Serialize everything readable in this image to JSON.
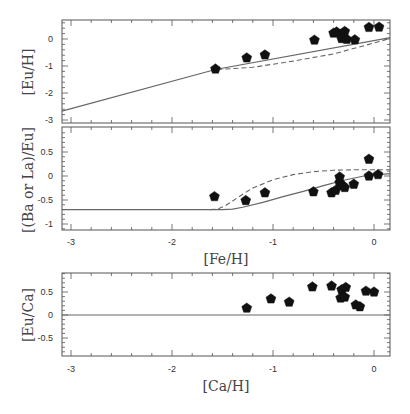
{
  "chart_data": [
    {
      "type": "scatter",
      "panel": "top",
      "title": "",
      "xlabel": "",
      "ylabel": "[Eu/H]",
      "xlim": [
        -3.09,
        0.16
      ],
      "ylim": [
        -3.1,
        0.7
      ],
      "xticks": [
        -3,
        -2,
        -1,
        0
      ],
      "yticks": [
        -3,
        -2,
        -1,
        0
      ],
      "ytick_labels": [
        "-3",
        "-2",
        "-1",
        "0"
      ],
      "grid": false,
      "series": [
        {
          "name": "observations",
          "kind": "points",
          "marker": "pentagon",
          "x": [
            -1.57,
            -1.26,
            -1.08,
            -0.59,
            -0.4,
            -0.37,
            -0.31,
            -0.29,
            -0.32,
            -0.27,
            -0.19,
            -0.05,
            0.05
          ],
          "y": [
            -1.11,
            -0.7,
            -0.59,
            -0.04,
            0.22,
            0.26,
            0.2,
            0.28,
            0.02,
            -0.01,
            -0.03,
            0.43,
            0.44
          ]
        },
        {
          "name": "model (solid)",
          "kind": "line",
          "style": "solid",
          "x": [
            -3.09,
            -1.57,
            0.16
          ],
          "y": [
            -2.67,
            -1.13,
            0.05
          ]
        },
        {
          "name": "model (dashed)",
          "kind": "line",
          "style": "dashed",
          "x": [
            -1.55,
            -1.2,
            -0.8,
            -0.4,
            0.0,
            0.16
          ],
          "y": [
            -1.13,
            -1.05,
            -0.82,
            -0.55,
            -0.15,
            0.02
          ]
        }
      ]
    },
    {
      "type": "scatter",
      "panel": "middle",
      "title": "",
      "xlabel": "[Fe/H]",
      "ylabel": "[(Ba or La)/Eu]",
      "xlim": [
        -3.09,
        0.16
      ],
      "ylim": [
        -1.1,
        0.95
      ],
      "xticks": [
        -3,
        -2,
        -1,
        0
      ],
      "xtick_labels": [
        "-3",
        "-2",
        "-1",
        "0"
      ],
      "yticks": [
        -1,
        -0.5,
        0,
        0.5
      ],
      "ytick_labels": [
        "-1",
        "-0.5",
        "0",
        "0.5"
      ],
      "grid": false,
      "series": [
        {
          "name": "observations",
          "kind": "points",
          "marker": "pentagon",
          "x": [
            -1.58,
            -1.27,
            -1.08,
            -0.6,
            -0.42,
            -0.38,
            -0.34,
            -0.34,
            -0.31,
            -0.29,
            -0.2,
            -0.05,
            -0.05,
            0.04
          ],
          "y": [
            -0.43,
            -0.51,
            -0.35,
            -0.33,
            -0.35,
            -0.3,
            -0.02,
            -0.14,
            -0.2,
            -0.24,
            -0.17,
            0.0,
            0.35,
            0.03
          ]
        },
        {
          "name": "model (solid)",
          "kind": "line",
          "style": "solid",
          "x": [
            -3.09,
            -2.0,
            -1.5,
            -1.4,
            -1.3,
            -1.1,
            -0.9,
            -0.7,
            -0.5,
            -0.3,
            -0.1,
            0.16
          ],
          "y": [
            -0.7,
            -0.7,
            -0.7,
            -0.69,
            -0.65,
            -0.55,
            -0.43,
            -0.32,
            -0.2,
            -0.09,
            0.0,
            0.05
          ]
        },
        {
          "name": "model (dashed)",
          "kind": "line",
          "style": "dashed",
          "x": [
            -1.62,
            -1.55,
            -1.48,
            -1.4,
            -1.3,
            -1.2,
            -1.0,
            -0.8,
            -0.6,
            -0.4,
            -0.2,
            0.16
          ],
          "y": [
            -0.7,
            -0.69,
            -0.63,
            -0.52,
            -0.38,
            -0.25,
            -0.08,
            0.03,
            0.09,
            0.12,
            0.13,
            0.13
          ]
        }
      ]
    },
    {
      "type": "scatter",
      "panel": "bottom",
      "title": "",
      "xlabel": "[Ca/H]",
      "ylabel": "[Eu/Ca]",
      "xlim": [
        -3.09,
        0.16
      ],
      "ylim": [
        -0.9,
        0.9
      ],
      "xticks": [
        -3,
        -2,
        -1,
        0
      ],
      "xtick_labels": [
        "-3",
        "-2",
        "-1",
        "0"
      ],
      "yticks": [
        -0.5,
        0,
        0.5
      ],
      "ytick_labels": [
        "-0.5",
        "0",
        "0.5"
      ],
      "grid": false,
      "series": [
        {
          "name": "observations",
          "kind": "points",
          "marker": "pentagon",
          "x": [
            -1.26,
            -1.02,
            -0.84,
            -0.61,
            -0.42,
            -0.32,
            -0.28,
            -0.33,
            -0.29,
            -0.18,
            -0.14,
            -0.08,
            0.0
          ],
          "y": [
            0.15,
            0.35,
            0.28,
            0.61,
            0.63,
            0.55,
            0.6,
            0.37,
            0.39,
            0.22,
            0.18,
            0.52,
            0.5
          ]
        },
        {
          "name": "reference (solid)",
          "kind": "line",
          "style": "solid",
          "x": [
            -3.09,
            0.16
          ],
          "y": [
            0.0,
            0.0
          ]
        }
      ]
    }
  ],
  "panels": {
    "top": {
      "ylabel": "[Eu/H]",
      "ytick_labels": [
        "-3",
        "-2",
        "-1",
        "0"
      ]
    },
    "middle": {
      "ylabel": "[(Ba or La)/Eu]",
      "xlabel": "[Fe/H]",
      "ytick_labels": [
        "-1",
        "-0.5",
        "0",
        "0.5"
      ],
      "xtick_labels": [
        "-3",
        "-2",
        "-1",
        "0"
      ]
    },
    "bottom": {
      "ylabel": "[Eu/Ca]",
      "xlabel": "[Ca/H]",
      "ytick_labels": [
        "-0.5",
        "0",
        "0.5"
      ],
      "xtick_labels": [
        "-3",
        "-2",
        "-1",
        "0"
      ]
    }
  },
  "colors": {
    "frame": "#555555",
    "line": "#666666",
    "marker": "#111111"
  }
}
